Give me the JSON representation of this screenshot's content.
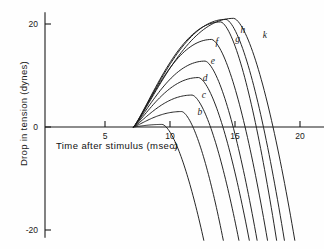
{
  "chart_data": {
    "type": "line",
    "title": "",
    "xlabel": "Time after stimulus (msec)",
    "ylabel": "Drop in tension (dynes)",
    "xlim": [
      0,
      22.5
    ],
    "ylim": [
      -22,
      23
    ],
    "xticks": [
      5,
      10,
      15,
      20
    ],
    "yticks": [
      20,
      0,
      -20
    ],
    "grid": false,
    "legend": "inline-curve-labels",
    "origin_time": 7.2,
    "series": [
      {
        "name": "a",
        "label": "a",
        "peak_t": 9.4,
        "peak_y": 0.5,
        "zero_t": 10.6,
        "end_t": 12.6
      },
      {
        "name": "b",
        "label": "b",
        "peak_t": 10.9,
        "peak_y": 3.0,
        "zero_t": 12.3,
        "end_t": 14.1
      },
      {
        "name": "c",
        "label": "c",
        "peak_t": 11.7,
        "peak_y": 6.2,
        "zero_t": 13.6,
        "end_t": 15.3
      },
      {
        "name": "d",
        "label": "d",
        "peak_t": 12.2,
        "peak_y": 9.6,
        "zero_t": 14.4,
        "end_t": 16.1
      },
      {
        "name": "e",
        "label": "e",
        "peak_t": 12.7,
        "peak_y": 12.8,
        "zero_t": 15.0,
        "end_t": 16.7
      },
      {
        "name": "f",
        "label": "f",
        "peak_t": 13.2,
        "peak_y": 17.0,
        "zero_t": 15.9,
        "end_t": 17.5
      },
      {
        "name": "g",
        "label": "g",
        "peak_t": 13.9,
        "peak_y": 20.4,
        "zero_t": 16.7,
        "end_t": 18.2
      },
      {
        "name": "h",
        "label": "h",
        "peak_t": 14.3,
        "peak_y": 20.9,
        "zero_t": 17.3,
        "end_t": 18.8
      },
      {
        "name": "k",
        "label": "k",
        "peak_t": 14.9,
        "peak_y": 21.1,
        "zero_t": 18.2,
        "end_t": 19.6
      }
    ],
    "curve_labels": [
      {
        "text": "a",
        "t": 10.4,
        "y": -4.2
      },
      {
        "text": "b",
        "t": 12.3,
        "y": 2.4
      },
      {
        "text": "c",
        "t": 12.6,
        "y": 5.6
      },
      {
        "text": "d",
        "t": 12.7,
        "y": 8.9
      },
      {
        "text": "e",
        "t": 13.3,
        "y": 12.2
      },
      {
        "text": "f",
        "t": 13.6,
        "y": 15.9
      },
      {
        "text": "g",
        "t": 15.2,
        "y": 16.5
      },
      {
        "text": "h",
        "t": 15.6,
        "y": 18.3
      },
      {
        "text": "k",
        "t": 17.3,
        "y": 17.2
      }
    ]
  },
  "axes": {
    "x_title": "Time after stimulus (msec)",
    "y_title": "Drop in tension (dynes)",
    "x_tick_labels": [
      "5",
      "10",
      "15",
      "20"
    ],
    "y_tick_labels": [
      "20",
      "0",
      "-20"
    ]
  },
  "style": {
    "ink": "#1a1a1a",
    "background": "#fefefe"
  }
}
